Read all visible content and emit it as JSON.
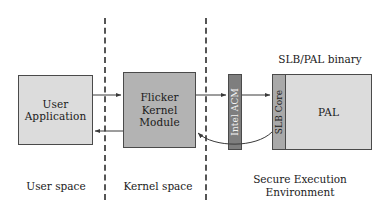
{
  "diagram": {
    "canvas": {
      "width": 388,
      "height": 220,
      "background": "#ffffff"
    },
    "boxes": {
      "user_application": {
        "label": "User\nApplication",
        "fill": "#dcdcdc"
      },
      "flicker_kernel_module": {
        "label": "Flicker\nKernel\nModule",
        "fill": "#b3b3b3"
      },
      "intel_acm": {
        "label": "Intel ACM",
        "fill": "#7e7e7e",
        "orientation": "vertical"
      },
      "slb_core": {
        "label": "SLB Core",
        "fill": "#a9a9a9",
        "orientation": "vertical"
      },
      "pal": {
        "label": "PAL",
        "fill": "#dcdcdc"
      }
    },
    "captions": {
      "slb_pal_binary": "SLB/PAL binary",
      "user_space": "User space",
      "kernel_space": "Kernel space",
      "secure_execution_environment": "Secure Execution\nEnvironment"
    },
    "dividers": [
      {
        "name": "user-kernel-divider",
        "style": "dashed",
        "color": "#555555"
      },
      {
        "name": "kernel-secure-divider",
        "style": "dashed",
        "color": "#555555"
      }
    ],
    "arrows": [
      {
        "name": "user-app-to-flicker",
        "direction": "right",
        "style": "straight"
      },
      {
        "name": "flicker-to-intel-acm",
        "direction": "right",
        "style": "straight"
      },
      {
        "name": "intel-acm-to-slb-core",
        "direction": "right",
        "style": "straight"
      },
      {
        "name": "flicker-to-user-app",
        "direction": "left",
        "style": "straight"
      },
      {
        "name": "slb-core-to-flicker",
        "direction": "left",
        "style": "curved"
      }
    ]
  }
}
